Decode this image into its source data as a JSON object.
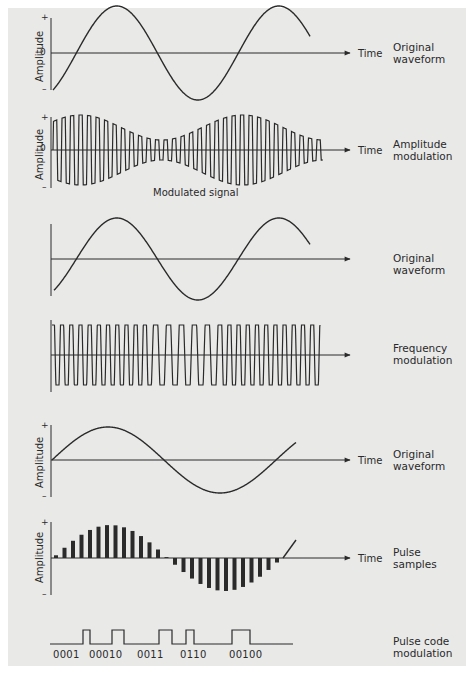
{
  "colors": {
    "panel_bg": "#e9e9e8",
    "ink": "#2a2a2a",
    "page_bg": "#ffffff"
  },
  "axis_labels": {
    "y": "Amplitude",
    "x": "Time",
    "plus": "+",
    "zero": "0",
    "minus": "–"
  },
  "sections": [
    {
      "id": "original-1",
      "title": "Original\nwaveform",
      "has_time": true,
      "has_ylabel": true,
      "has_zero": true
    },
    {
      "id": "am",
      "title": "Amplitude\nmodulation",
      "has_time": true,
      "has_ylabel": true,
      "has_zero": true,
      "caption": "Modulated signal"
    },
    {
      "id": "original-2",
      "title": "Original\nwaveform",
      "has_time": false,
      "has_ylabel": false,
      "has_zero": false
    },
    {
      "id": "fm",
      "title": "Frequency\nmodulation",
      "has_time": false,
      "has_ylabel": false,
      "has_zero": false
    },
    {
      "id": "original-3",
      "title": "Original\nwaveform",
      "has_time": true,
      "has_ylabel": true,
      "has_zero": false
    },
    {
      "id": "pulse",
      "title": "Pulse\nsamples",
      "has_time": true,
      "has_ylabel": true,
      "has_zero": false
    },
    {
      "id": "pcm",
      "title": "Pulse code\nmodulation",
      "has_time": false,
      "has_ylabel": false,
      "has_zero": false
    }
  ],
  "pcm_codes": [
    "0001",
    "00010",
    "0011",
    "0110",
    "00100"
  ]
}
